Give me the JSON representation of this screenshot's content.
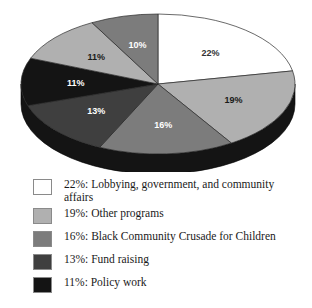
{
  "chart_data": {
    "type": "pie",
    "title": "",
    "three_d": true,
    "legend_position": "bottom",
    "categories": [
      "Lobbying, government, and community affairs",
      "Other programs",
      "Black Community Crusade for Children",
      "Fund raising",
      "Policy work",
      "Other programs",
      "Black Community Crusade for Children"
    ],
    "slices": [
      {
        "label": "22%",
        "value": 22,
        "color": "#ffffff",
        "label_color": "#333333",
        "start_angle": 0,
        "end_angle": 79.2
      },
      {
        "label": "19%",
        "value": 19,
        "color": "#b0b0b0",
        "label_color": "#1a1a1a",
        "start_angle": 79.2,
        "end_angle": 147.6
      },
      {
        "label": "16%",
        "value": 16,
        "color": "#7c7c7c",
        "label_color": "#ffffff",
        "start_angle": 147.6,
        "end_angle": 205.2
      },
      {
        "label": "13%",
        "value": 13,
        "color": "#3f3f3f",
        "label_color": "#ffffff",
        "start_angle": 205.2,
        "end_angle": 252.0
      },
      {
        "label": "11%",
        "value": 11,
        "color": "#141414",
        "label_color": "#ffffff",
        "start_angle": 252.0,
        "end_angle": 291.6
      },
      {
        "label": "11%",
        "value": 11,
        "color": "#b0b0b0",
        "label_color": "#1a1a1a",
        "start_angle": 291.6,
        "end_angle": 331.2
      },
      {
        "label": "10%",
        "value": 10,
        "color": "#7c7c7c",
        "label_color": "#ffffff",
        "start_angle": 331.2,
        "end_angle": 360.0
      }
    ],
    "values": [
      22,
      19,
      16,
      13,
      11,
      11,
      10
    ],
    "side_wall_color": "#141414"
  },
  "legend": {
    "items": [
      {
        "percent": "22%",
        "label": "Lobbying, government, and community\naffairs",
        "text": "22%:  Lobbying, government, and community\naffairs",
        "color": "#ffffff"
      },
      {
        "percent": "19%",
        "label": "Other programs",
        "text": "19%:  Other programs",
        "color": "#b0b0b0"
      },
      {
        "percent": "16%",
        "label": "Black Community Crusade for Children",
        "text": "16%:  Black Community Crusade for Children",
        "color": "#7c7c7c"
      },
      {
        "percent": "13%",
        "label": "Fund raising",
        "text": "13%:  Fund raising",
        "color": "#3f3f3f"
      },
      {
        "percent": "11%",
        "label": "Policy work",
        "text": "11%:  Policy work",
        "color": "#141414"
      }
    ]
  }
}
